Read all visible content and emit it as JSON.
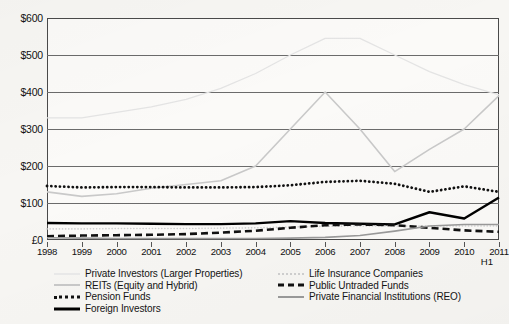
{
  "chart_data": {
    "type": "line",
    "title": "",
    "xlabel": "",
    "ylabel": "",
    "ylim": [
      0,
      600
    ],
    "ytick_labels": [
      "$600",
      "$500",
      "$400",
      "$300",
      "$200",
      "$100",
      "£0"
    ],
    "ytick_values": [
      600,
      500,
      400,
      300,
      200,
      100,
      0
    ],
    "grid": true,
    "legend_position": "below",
    "currency_note": "Axis labels use $ for all ticks except the zero tick which reads £0",
    "categories": [
      "1998",
      "1999",
      "2000",
      "2001",
      "2002",
      "2003",
      "2004",
      "2005",
      "2006",
      "2007",
      "2008",
      "2009",
      "2010",
      "2011 H1"
    ],
    "x_axis_last_label_extra": "H1",
    "series": [
      {
        "name": "Private Investors (Larger Properties)",
        "style": "solid-very-light",
        "color": "#e4e4e4",
        "values": [
          330,
          330,
          345,
          360,
          380,
          410,
          450,
          500,
          545,
          545,
          500,
          455,
          420,
          392
        ]
      },
      {
        "name": "REITs (Equity and Hybrid)",
        "style": "solid-light",
        "color": "#c9c9c9",
        "values": [
          130,
          118,
          125,
          140,
          150,
          160,
          200,
          300,
          400,
          300,
          185,
          245,
          300,
          390
        ]
      },
      {
        "name": "Pension Funds",
        "style": "dotted-bold",
        "color": "#111111",
        "values": [
          146,
          142,
          143,
          143,
          142,
          142,
          143,
          148,
          157,
          160,
          152,
          130,
          145,
          130
        ]
      },
      {
        "name": "Foreign Investors",
        "style": "solid-bold",
        "color": "#000000",
        "values": [
          46,
          45,
          45,
          44,
          43,
          43,
          45,
          51,
          46,
          44,
          42,
          75,
          58,
          115
        ]
      },
      {
        "name": "Life Insurance Companies",
        "style": "dotted-fine-light",
        "color": "#cfcfcf",
        "values": [
          30,
          30,
          31,
          31,
          31,
          32,
          33,
          35,
          37,
          38,
          38,
          38,
          38,
          38
        ]
      },
      {
        "name": "Public Untraded Funds",
        "style": "dashed-bold",
        "color": "#111111",
        "values": [
          10,
          12,
          13,
          14,
          16,
          20,
          25,
          33,
          40,
          42,
          40,
          33,
          26,
          22
        ]
      },
      {
        "name": "Private Financial Institutions (REO)",
        "style": "solid-medium",
        "color": "#9a9a9a",
        "values": [
          6,
          5,
          4,
          4,
          4,
          4,
          4,
          5,
          7,
          12,
          24,
          38,
          42,
          42
        ]
      }
    ]
  },
  "legend": {
    "left_column": [
      {
        "label": "Private Investors (Larger Properties)",
        "key": "k-private"
      },
      {
        "label": "REITs (Equity and Hybrid)",
        "key": "k-reits"
      },
      {
        "label": "Pension Funds",
        "key": "k-pension"
      },
      {
        "label": "Foreign Investors",
        "key": "k-foreign"
      }
    ],
    "right_column": [
      {
        "label": "Life Insurance Companies",
        "key": "k-life"
      },
      {
        "label": "Public Untraded Funds",
        "key": "k-untraded"
      },
      {
        "label": "Private Financial Institutions (REO)",
        "key": "k-reo"
      }
    ]
  }
}
